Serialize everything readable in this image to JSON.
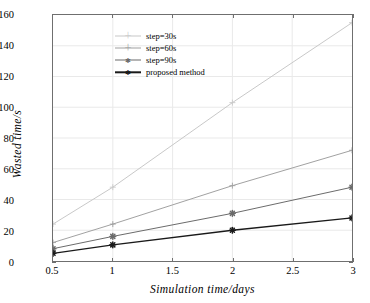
{
  "chart_data": {
    "type": "line",
    "title": "",
    "xlabel": "Simulation  time/days",
    "ylabel": "Wasted  time/s",
    "xlim": [
      0.5,
      3
    ],
    "ylim": [
      0,
      160
    ],
    "xticks": [
      "0.5",
      "1",
      "1.5",
      "2",
      "2.5",
      "3"
    ],
    "xtick_values": [
      0.5,
      1,
      1.5,
      2,
      2.5,
      3
    ],
    "yticks": [
      "0",
      "20",
      "40",
      "60",
      "80",
      "100",
      "120",
      "140",
      "160"
    ],
    "ytick_values": [
      0,
      20,
      40,
      60,
      80,
      100,
      120,
      140,
      160
    ],
    "grid": true,
    "legend_position": "upper left",
    "x": [
      0.5,
      1,
      2,
      3
    ],
    "series": [
      {
        "name": "step=30s",
        "values": [
          24,
          48,
          103,
          155
        ],
        "color": "#c8c8c8",
        "marker": "plus"
      },
      {
        "name": "step=60s",
        "values": [
          12,
          24,
          49,
          72
        ],
        "color": "#a0a0a0",
        "marker": "plus"
      },
      {
        "name": "step=90s",
        "values": [
          8,
          16,
          31,
          48
        ],
        "color": "#6a6a6a",
        "marker": "asterisk"
      },
      {
        "name": "proposed method",
        "values": [
          5,
          10.5,
          20,
          28
        ],
        "color": "#1a1a1a",
        "marker": "asterisk"
      }
    ]
  },
  "axes": {
    "frame_color": "#6f6f6f",
    "grid_color": "#e9e9e9",
    "background": "#ffffff"
  }
}
